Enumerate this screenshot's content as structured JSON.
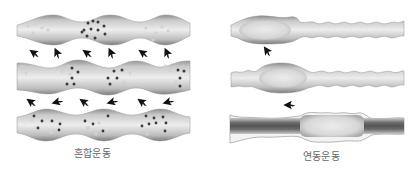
{
  "panels": [
    {
      "id": "mixing",
      "label": "혼합운동",
      "tubes": 3,
      "arrow_rows": 2,
      "arrows_per_row": 6
    },
    {
      "id": "peristalsis",
      "label": "연동운동",
      "tubes": 3,
      "arrows": 2
    }
  ],
  "colors": {
    "tube_light": "#e8e8e8",
    "tube_mid": "#b5b5b5",
    "tube_dark": "#6f6f6f",
    "particle_dark": "#3a3a3a",
    "particle_light": "#cfcfcf",
    "arrow": "#111111",
    "label_text": "#666666"
  }
}
